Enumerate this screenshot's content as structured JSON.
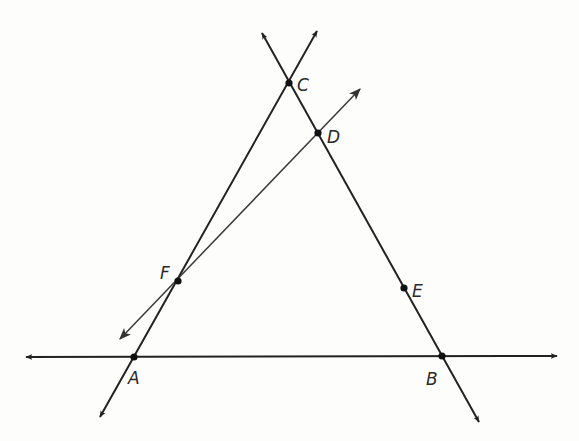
{
  "diagram": {
    "background": "#fdfdfc",
    "line_color": "#222222",
    "points": [
      {
        "label": "A",
        "x": 134,
        "y": 357,
        "label_x": 128,
        "label_y": 384
      },
      {
        "label": "B",
        "x": 442,
        "y": 356,
        "label_x": 426,
        "label_y": 385
      },
      {
        "label": "C",
        "x": 289,
        "y": 83,
        "label_x": 297,
        "label_y": 91
      },
      {
        "label": "D",
        "x": 318,
        "y": 133,
        "label_x": 327,
        "label_y": 143
      },
      {
        "label": "E",
        "x": 404,
        "y": 288,
        "label_x": 412,
        "label_y": 297
      },
      {
        "label": "F",
        "x": 178,
        "y": 281,
        "label_x": 160,
        "label_y": 279
      }
    ],
    "lines": [
      {
        "name": "line-AB",
        "from": [
          26,
          357
        ],
        "to": [
          557,
          356
        ],
        "arrows": "both"
      },
      {
        "name": "line-AC",
        "from": [
          100,
          417
        ],
        "to": [
          317,
          31
        ],
        "arrows": "both"
      },
      {
        "name": "line-BC",
        "from": [
          479,
          422
        ],
        "to": [
          262,
          33
        ],
        "arrows": "both"
      },
      {
        "name": "line-FD",
        "from": [
          120,
          339
        ],
        "to": [
          360,
          89
        ],
        "arrows": "both"
      }
    ]
  }
}
